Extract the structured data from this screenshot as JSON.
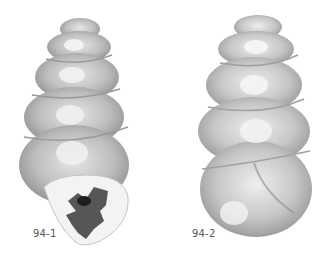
{
  "figure": {
    "specimens": [
      {
        "id": "94-1",
        "label": "94-1",
        "view": "apertural"
      },
      {
        "id": "94-2",
        "label": "94-2",
        "view": "lateral"
      }
    ],
    "colors": {
      "background": "#ffffff",
      "shell_light": "#ececec",
      "shell_mid": "#b5b5b5",
      "shell_dark": "#8a8a8a",
      "aperture_dark": "#3a3a3a",
      "label": "#555555"
    }
  }
}
